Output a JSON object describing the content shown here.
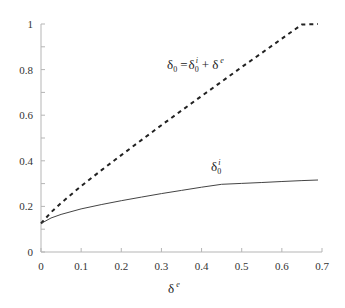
{
  "chart_data": {
    "type": "line",
    "title": "",
    "xlabel": "δe",
    "xlabel_base": "δ",
    "xlabel_sup": "e",
    "ylabel": "",
    "xlim": [
      0,
      0.7
    ],
    "ylim": [
      0,
      1
    ],
    "grid": false,
    "x_ticks": [
      "0",
      "0.1",
      "0.2",
      "0.3",
      "0.4",
      "0.5",
      "0.6",
      "0.7"
    ],
    "y_ticks": [
      "0",
      "0.2",
      "0.4",
      "0.6",
      "0.8",
      "1"
    ],
    "y_minor_step": 0.1,
    "x": [
      0,
      0.025,
      0.05,
      0.1,
      0.15,
      0.2,
      0.25,
      0.3,
      0.35,
      0.4,
      0.45,
      0.5,
      0.55,
      0.6,
      0.65,
      0.69
    ],
    "series": [
      {
        "name": "δ0 = δ0i + δe",
        "style": "dashed",
        "color": "#222222",
        "values": [
          0.125,
          0.174,
          0.215,
          0.289,
          0.358,
          0.425,
          0.491,
          0.556,
          0.62,
          0.684,
          0.747,
          0.811,
          0.873,
          0.936,
          0.998,
          1.0
        ]
      },
      {
        "name": "δ0i",
        "style": "solid",
        "color": "#444444",
        "values": [
          0.125,
          0.149,
          0.165,
          0.189,
          0.208,
          0.225,
          0.241,
          0.256,
          0.27,
          0.284,
          0.297,
          0.301,
          0.305,
          0.309,
          0.313,
          0.316
        ]
      }
    ],
    "annotations": [
      {
        "text": "δ0 = δ0i + δe",
        "parts": {
          "lhs_base": "δ",
          "lhs_sub": "0",
          "eq": "=",
          "r1_base": "δ",
          "r1_sub": "0",
          "r1_sup": "i",
          "plus": "+",
          "r2_base": "δ",
          "r2_sup": "e"
        },
        "x": 0.315,
        "y": 0.82
      },
      {
        "text": "δ0i",
        "parts": {
          "base": "δ",
          "sub": "0",
          "sup": "i"
        },
        "x": 0.43,
        "y": 0.37
      }
    ],
    "legend": "none (inline annotations)"
  }
}
